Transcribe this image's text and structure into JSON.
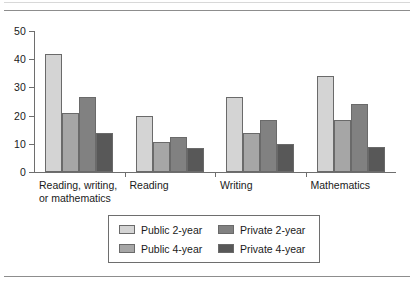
{
  "figure": {
    "background": "#ffffff",
    "rule_color": "#8d8d8d"
  },
  "legend": {
    "position": "below-plot",
    "entries": [
      {
        "label": "Public 2-year",
        "color": "#d4d4d4"
      },
      {
        "label": "Public 4-year",
        "color": "#a6a6a6"
      },
      {
        "label": "Private 2-year",
        "color": "#818181"
      },
      {
        "label": "Private 4-year",
        "color": "#585858"
      }
    ]
  },
  "chart_data": {
    "type": "bar",
    "title": "",
    "xlabel": "",
    "ylabel": "",
    "grid": false,
    "legend_position": "bottom",
    "ylim": [
      0,
      50
    ],
    "yticks": [
      0,
      10,
      20,
      30,
      40,
      50
    ],
    "ytick_labels": [
      "0",
      "10",
      "20",
      "30",
      "40",
      "50"
    ],
    "categories": [
      "Reading, writing,\nor mathematics",
      "Reading",
      "Writing",
      "Mathematics"
    ],
    "series": [
      {
        "name": "Public 2-year",
        "color": "#d4d4d4",
        "values": [
          42.0,
          20.0,
          26.5,
          34.0
        ]
      },
      {
        "name": "Public 4-year",
        "color": "#a6a6a6",
        "values": [
          21.0,
          10.5,
          14.0,
          18.5
        ]
      },
      {
        "name": "Private 2-year",
        "color": "#818181",
        "values": [
          26.5,
          12.5,
          18.5,
          24.0
        ]
      },
      {
        "name": "Private 4-year",
        "color": "#585858",
        "values": [
          14.0,
          8.5,
          10.0,
          9.0
        ]
      }
    ]
  }
}
